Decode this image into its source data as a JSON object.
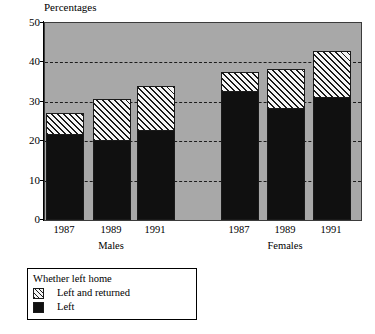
{
  "chart_data": {
    "type": "bar",
    "title": "Percentages",
    "subtitle": "",
    "xlabel": "",
    "ylabel": "Percentages",
    "ylim": [
      0,
      50
    ],
    "ytick_values": [
      0,
      10,
      20,
      30,
      40,
      50
    ],
    "ytick_labels": [
      "0",
      "10",
      "20",
      "30",
      "40",
      "50"
    ],
    "grid": true,
    "gridlines_at": [
      10,
      20,
      30,
      40
    ],
    "legend_position": "below-left",
    "legend_title": "Whether left home",
    "stacked": true,
    "categories": [
      "1987",
      "1989",
      "1991",
      "1987",
      "1989",
      "1991"
    ],
    "groups": [
      {
        "name": "Males",
        "categories": [
          "1987",
          "1989",
          "1991"
        ]
      },
      {
        "name": "Females",
        "categories": [
          "1987",
          "1989",
          "1991"
        ]
      }
    ],
    "series": [
      {
        "name": "Left",
        "pattern": "solid",
        "color": "#101010",
        "values": [
          22,
          20.5,
          23,
          33,
          28.7,
          31.5
        ]
      },
      {
        "name": "Left and returned",
        "pattern": "diagonal-hatch",
        "color": "#f2f2f2",
        "values": [
          5.2,
          10.2,
          11,
          4.6,
          9.6,
          11.5
        ]
      }
    ],
    "totals": [
      27.2,
      30.7,
      34,
      37.6,
      38.3,
      43
    ],
    "plot_background": "#a8a8a8",
    "bars": [
      {
        "group": "Males",
        "category": "1987",
        "left": 22,
        "left_and_returned": 5.2,
        "total": 27.2
      },
      {
        "group": "Males",
        "category": "1989",
        "left": 20.5,
        "left_and_returned": 10.2,
        "total": 30.7
      },
      {
        "group": "Males",
        "category": "1991",
        "left": 23,
        "left_and_returned": 11,
        "total": 34
      },
      {
        "group": "Females",
        "category": "1987",
        "left": 33,
        "left_and_returned": 4.6,
        "total": 37.6
      },
      {
        "group": "Females",
        "category": "1989",
        "left": 28.7,
        "left_and_returned": 9.6,
        "total": 38.3
      },
      {
        "group": "Females",
        "category": "1991",
        "left": 31.5,
        "left_and_returned": 11.5,
        "total": 43
      }
    ]
  },
  "axis": {
    "title": "Percentages",
    "ticks": [
      {
        "label": "50",
        "value": 50
      },
      {
        "label": "40",
        "value": 40
      },
      {
        "label": "30",
        "value": 30
      },
      {
        "label": "20",
        "value": 20
      },
      {
        "label": "10",
        "value": 10
      },
      {
        "label": "0",
        "value": 0
      }
    ]
  },
  "x_labels": [
    "1987",
    "1989",
    "1991",
    "1987",
    "1989",
    "1991"
  ],
  "group_labels": [
    "Males",
    "Females"
  ],
  "legend": {
    "title": "Whether left home",
    "items": [
      {
        "label": "Left and returned",
        "swatch": "hatched"
      },
      {
        "label": "Left",
        "swatch": "solid"
      }
    ]
  }
}
